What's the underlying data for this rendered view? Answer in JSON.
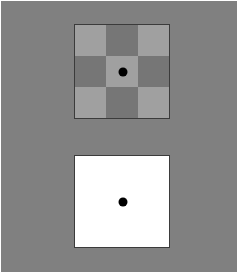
{
  "figure": {
    "title": "Simultaneous contrast stimulus pair",
    "width": 244,
    "height": 279,
    "page_background": "#ffffff",
    "surround_color": "#808080",
    "surround_label": "uniform mid-gray surround"
  },
  "palette": {
    "page_white": "#ffffff",
    "surround_gray": "#808080",
    "checker_light": "#a0a0a0",
    "checker_dark": "#767676",
    "stimulus_border": "#3b3b3b",
    "fixation_dot": "#000000",
    "uniform_patch": "#ffffff"
  },
  "stimuli": [
    {
      "id": "checkerboard",
      "name": "checkerboard-stimulus",
      "label": "Checkerboard test patch",
      "border_color": "#3b3b3b",
      "border_width_px": 1,
      "bounds": {
        "x": 74,
        "y": 24,
        "width": 96,
        "height": 95
      },
      "grid": {
        "rows": 3,
        "cols": 3,
        "cells": [
          {
            "row": 0,
            "col": 0,
            "tone": "light",
            "color": "#a0a0a0"
          },
          {
            "row": 0,
            "col": 1,
            "tone": "dark",
            "color": "#767676"
          },
          {
            "row": 0,
            "col": 2,
            "tone": "light",
            "color": "#a0a0a0"
          },
          {
            "row": 1,
            "col": 0,
            "tone": "dark",
            "color": "#767676"
          },
          {
            "row": 1,
            "col": 1,
            "tone": "light",
            "color": "#a0a0a0"
          },
          {
            "row": 1,
            "col": 2,
            "tone": "dark",
            "color": "#767676"
          },
          {
            "row": 2,
            "col": 0,
            "tone": "light",
            "color": "#a0a0a0"
          },
          {
            "row": 2,
            "col": 1,
            "tone": "dark",
            "color": "#767676"
          },
          {
            "row": 2,
            "col": 2,
            "tone": "light",
            "color": "#a0a0a0"
          }
        ]
      },
      "fixation_dot": {
        "label": "fixation dot",
        "color": "#000000",
        "diameter_px": 9,
        "center": {
          "x": 122,
          "y": 71
        }
      }
    },
    {
      "id": "uniform",
      "name": "uniform-stimulus",
      "label": "Uniform white comparison patch",
      "border_color": "#3b3b3b",
      "border_width_px": 1,
      "fill_color": "#ffffff",
      "bounds": {
        "x": 74,
        "y": 155,
        "width": 96,
        "height": 93
      },
      "fixation_dot": {
        "label": "fixation dot",
        "color": "#000000",
        "diameter_px": 9,
        "center": {
          "x": 122,
          "y": 201
        }
      }
    }
  ]
}
